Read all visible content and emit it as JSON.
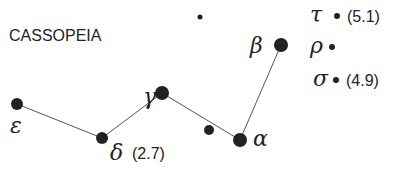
{
  "diagram": {
    "title": "CASSOPEIA",
    "stars": [
      {
        "id": "epsilon",
        "label": "ε",
        "x": 17,
        "y": 104,
        "r": 6,
        "lx": 10,
        "ly": 133,
        "mag": ""
      },
      {
        "id": "delta",
        "label": "δ",
        "x": 102,
        "y": 138,
        "r": 6,
        "lx": 110,
        "ly": 160,
        "mag": "(2.7)"
      },
      {
        "id": "gamma",
        "label": "γ",
        "x": 162,
        "y": 93,
        "r": 7,
        "lx": 143,
        "ly": 104,
        "mag": ""
      },
      {
        "id": "unnamed-1",
        "label": "",
        "x": 209,
        "y": 130,
        "r": 5,
        "mag": ""
      },
      {
        "id": "alpha",
        "label": "α",
        "x": 240,
        "y": 140,
        "r": 7,
        "lx": 253,
        "ly": 146,
        "mag": ""
      },
      {
        "id": "beta",
        "label": "β",
        "x": 281,
        "y": 45,
        "r": 7,
        "lx": 250,
        "ly": 53,
        "mag": ""
      },
      {
        "id": "unnamed-top",
        "label": "",
        "x": 200,
        "y": 17,
        "r": 2.5,
        "mag": ""
      },
      {
        "id": "tau",
        "label": "τ",
        "x": 337,
        "y": 16,
        "r": 3,
        "lx": 310,
        "ly": 22,
        "mag": "(5.1)"
      },
      {
        "id": "rho",
        "label": "ρ",
        "x": 332,
        "y": 47,
        "r": 3,
        "lx": 310,
        "ly": 53,
        "mag": ""
      },
      {
        "id": "sigma",
        "label": "σ",
        "x": 336,
        "y": 80,
        "r": 3,
        "lx": 313,
        "ly": 86,
        "mag": "(4.9)"
      }
    ],
    "lines": [
      [
        "epsilon",
        "delta"
      ],
      [
        "delta",
        "gamma"
      ],
      [
        "gamma",
        "alpha"
      ],
      [
        "alpha",
        "beta"
      ]
    ]
  }
}
